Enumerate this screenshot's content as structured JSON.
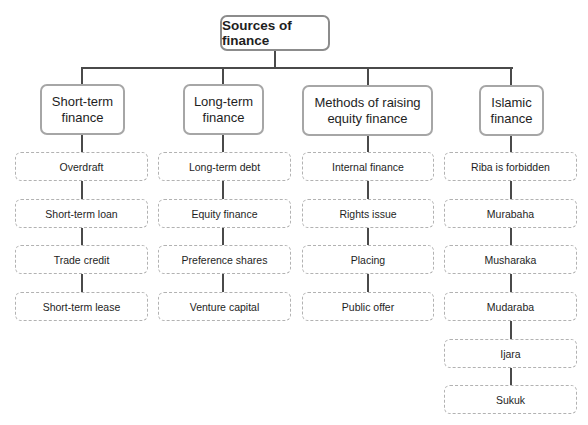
{
  "diagram": {
    "title": "Sources of finance",
    "columns": [
      {
        "label": "Short-term finance",
        "label_lines": [
          "Short-term",
          "finance"
        ],
        "items": [
          "Overdraft",
          "Short-term loan",
          "Trade credit",
          "Short-term lease"
        ]
      },
      {
        "label": "Long-term finance",
        "label_lines": [
          "Long-term",
          "finance"
        ],
        "items": [
          "Long-term debt",
          "Equity finance",
          "Preference shares",
          "Venture capital"
        ]
      },
      {
        "label": "Methods of raising equity finance",
        "label_lines": [
          "Methods of raising",
          "equity finance"
        ],
        "items": [
          "Internal finance",
          "Rights issue",
          "Placing",
          "Public offer"
        ]
      },
      {
        "label": "Islamic finance",
        "label_lines": [
          "Islamic",
          "finance"
        ],
        "items": [
          "Riba is forbidden",
          "Murabaha",
          "Musharaka",
          "Mudaraba",
          "Ijara",
          "Sukuk"
        ]
      }
    ]
  },
  "colors": {
    "connector": "#4a4a4a",
    "root_border": "#8c8c8c",
    "header_border": "#a6a6a6",
    "leaf_border": "#b2b2b2"
  }
}
